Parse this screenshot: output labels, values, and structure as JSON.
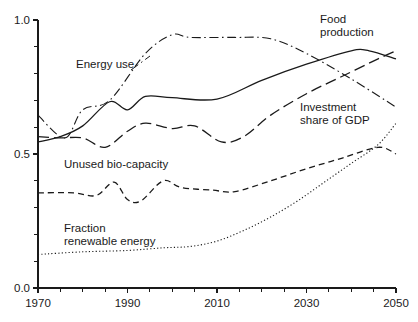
{
  "chart_data": {
    "type": "line",
    "title": "",
    "subtitle": "",
    "xlabel": "",
    "ylabel": "",
    "xlim": [
      1970,
      2050
    ],
    "ylim": [
      0.0,
      1.0
    ],
    "grid": false,
    "legend_position": "inline-annotations",
    "x_ticks_major": [
      "1970",
      "1990",
      "2010",
      "2030",
      "2050"
    ],
    "x_ticks_major_values": [
      1970,
      1990,
      2010,
      2030,
      2050
    ],
    "x_ticks_minor_values": [
      1975,
      1980,
      1985,
      1995,
      2000,
      2005,
      2015,
      2020,
      2025,
      2035,
      2040,
      2045
    ],
    "y_ticks_major": [
      "0.0",
      "0.5",
      "1.0"
    ],
    "y_ticks_major_values": [
      0.0,
      0.5,
      1.0
    ],
    "y_ticks_minor_values": [
      0.1,
      0.2,
      0.3,
      0.4,
      0.6,
      0.7,
      0.8,
      0.9
    ],
    "series": [
      {
        "name": "Food production",
        "dash": "solid",
        "color": "#1a1a1a",
        "width": 1.3,
        "label": "Food production",
        "label_lines": [
          "Food",
          "production"
        ],
        "x": [
          1970,
          1975,
          1980,
          1986,
          1990,
          1994,
          2000,
          2010,
          2020,
          2030,
          2040,
          2044,
          2050
        ],
        "values": [
          0.545,
          0.565,
          0.605,
          0.695,
          0.665,
          0.715,
          0.71,
          0.705,
          0.775,
          0.835,
          0.885,
          0.885,
          0.855
        ]
      },
      {
        "name": "Energy use",
        "dash": "dashdot",
        "color": "#1a1a1a",
        "width": 1.1,
        "label": "Energy use",
        "label_lines": [
          "Energy use"
        ],
        "x": [
          1970,
          1976,
          1980,
          1986,
          1994,
          2000,
          2004,
          2014,
          2022,
          2030,
          2040,
          2050
        ],
        "values": [
          0.645,
          0.56,
          0.665,
          0.7,
          0.875,
          0.945,
          0.935,
          0.935,
          0.93,
          0.875,
          0.78,
          0.675
        ]
      },
      {
        "name": "Investment share of GDP",
        "dash": "longdash",
        "color": "#1a1a1a",
        "width": 1.3,
        "label": "Investment share of GDP",
        "label_lines": [
          "Investment",
          "share of GDP"
        ],
        "x": [
          1970,
          1975,
          1980,
          1985,
          1990,
          1994,
          2000,
          2005,
          2011,
          2016,
          2022,
          2030,
          2038,
          2046,
          2050
        ],
        "values": [
          0.565,
          0.56,
          0.56,
          0.525,
          0.585,
          0.615,
          0.595,
          0.605,
          0.545,
          0.565,
          0.645,
          0.725,
          0.79,
          0.855,
          0.885
        ]
      },
      {
        "name": "Unused bio-capacity",
        "dash": "dashed",
        "color": "#1a1a1a",
        "width": 1.3,
        "label": "Unused bio-capacity",
        "label_lines": [
          "Unused bio-capacity"
        ],
        "x": [
          1970,
          1978,
          1983,
          1987,
          1990,
          1993,
          1998,
          2002,
          2009,
          2014,
          2022,
          2030,
          2038,
          2046,
          2050
        ],
        "values": [
          0.355,
          0.355,
          0.345,
          0.395,
          0.33,
          0.325,
          0.4,
          0.375,
          0.365,
          0.36,
          0.4,
          0.445,
          0.485,
          0.525,
          0.5
        ]
      },
      {
        "name": "Fraction renewable energy",
        "dash": "dotted",
        "color": "#1a1a1a",
        "width": 1.1,
        "label": "Fraction renewable energy",
        "label_lines": [
          "Fraction",
          "renewable energy"
        ],
        "x": [
          1970,
          1980,
          1990,
          1998,
          2004,
          2010,
          2016,
          2022,
          2028,
          2034,
          2040,
          2046,
          2050
        ],
        "values": [
          0.125,
          0.135,
          0.14,
          0.15,
          0.155,
          0.175,
          0.215,
          0.265,
          0.325,
          0.395,
          0.465,
          0.535,
          0.615
        ]
      }
    ],
    "annotations": [
      {
        "text": "Energy use",
        "x_px": 77,
        "y_px": 66
      },
      {
        "text": "Food production",
        "x_px": 352,
        "y_px": 22
      },
      {
        "text": "Investment share of GDP",
        "x_px": 302,
        "y_px": 110
      },
      {
        "text": "Unused bio-capacity",
        "x_px": 67,
        "y_px": 166
      },
      {
        "text": "Fraction renewable energy",
        "x_px": 66,
        "y_px": 230
      }
    ]
  },
  "labels": {
    "food_production_l1": "Food",
    "food_production_l2": "production",
    "energy_use": "Energy use",
    "investment_l1": "Investment",
    "investment_l2": "share of GDP",
    "unused_biocapacity": "Unused bio-capacity",
    "fraction_l1": "Fraction",
    "fraction_l2": "renewable energy",
    "y_top": "1.0",
    "y_mid": "0.5",
    "y_bottom": "0.0",
    "x_1970": "1970",
    "x_1990": "1990",
    "x_2010": "2010",
    "x_2030": "2030",
    "x_2050": "2050"
  }
}
